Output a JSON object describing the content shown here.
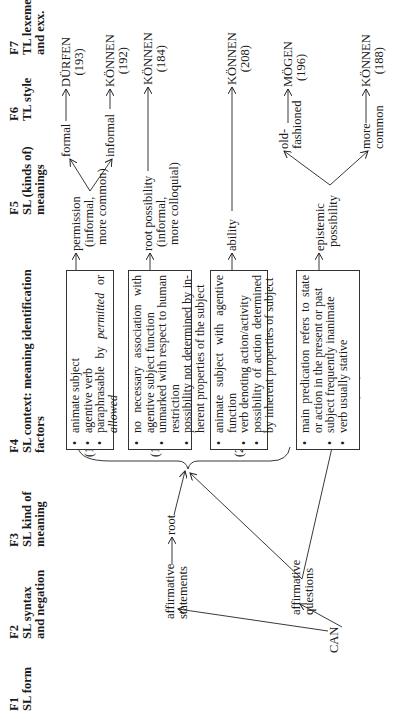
{
  "headers": [
    {
      "id": "F1",
      "label": "SL form"
    },
    {
      "id": "F2",
      "label": "SL syntax",
      "label2": "and negation"
    },
    {
      "id": "F3",
      "label": "SL kind of",
      "label2": "meaning"
    },
    {
      "id": "F4",
      "label": "SL context: meaning identification",
      "label2": "factors"
    },
    {
      "id": "F5",
      "label": "SL (kinds of)",
      "label2": "meanings"
    },
    {
      "id": "F6",
      "label": "TL style"
    },
    {
      "id": "F7",
      "label": "TL lexemes",
      "label2": "and exx."
    }
  ],
  "f1": {
    "form": "CAN"
  },
  "f2": {
    "statements_1": "affirmative",
    "statements_2": "statements",
    "questions_1": "affirmative",
    "questions_2": "questions"
  },
  "f3": {
    "root": "root"
  },
  "refs": {
    "r1": "(190)",
    "r2": "(181)",
    "r3": "(207)",
    "r4a": "(194)",
    "r4b": "(186)"
  },
  "boxes": [
    {
      "items": [
        "animate subject",
        "agentive verb",
        "paraphrasable by permitted or allowed"
      ],
      "item3_pre": "paraphrasable by ",
      "item3_em1": "permitted",
      "item3_mid": " or ",
      "item3_em2": "allowed"
    },
    {
      "items": [
        "no necessary association with agentive subject function",
        "unmarked with respect to human restriction",
        "possibility not determined by in-herent properties of the subject"
      ]
    },
    {
      "items": [
        "animate subject with agentive function",
        "verb denoting action/activity",
        "possibility of action determined by inherent properties of subject"
      ]
    },
    {
      "items": [
        "main predication refers to state or action in the present or past",
        "subject frequently inanimate",
        "verb usually stative"
      ]
    }
  ],
  "meanings": [
    {
      "label": "permission",
      "sub1": "(informal,",
      "sub2": "more common)"
    },
    {
      "label": "root possibility",
      "sub1": "(informal,",
      "sub2": "more colloquial)"
    },
    {
      "label": "ability"
    },
    {
      "label": "epistemic",
      "sub1": "possibility"
    }
  ],
  "styles": {
    "formal": "formal",
    "informal": "informal",
    "old1": "old-",
    "old2": "fashioned",
    "more1": "more",
    "more2": "common"
  },
  "lexemes": [
    {
      "word": "DÜRFEN",
      "ref": "(193)"
    },
    {
      "word": "KÖNNEN",
      "ref": "(192)"
    },
    {
      "word": "KÖNNEN",
      "ref": "(184)"
    },
    {
      "word": "KÖNNEN",
      "ref": "(208)"
    },
    {
      "word": "MÖGEN",
      "ref": "(196)"
    },
    {
      "word": "KÖNNEN",
      "ref": "(188)"
    }
  ]
}
